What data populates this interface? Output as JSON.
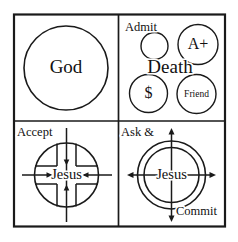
{
  "diagram": {
    "stroke_color": "#1a1a1a",
    "background_color": "#ffffff",
    "panels": [
      {
        "id": "panel-god",
        "position": "top-left",
        "center_label": "God",
        "shapes": "one large circle"
      },
      {
        "id": "panel-death",
        "position": "top-right",
        "heading_label": "Admit",
        "center_label": "Death",
        "circles": [
          {
            "id": "circle-empty",
            "label": ""
          },
          {
            "id": "circle-a-plus",
            "label": "A+"
          },
          {
            "id": "circle-dollar",
            "label": "$"
          },
          {
            "id": "circle-friend",
            "label": "Friend"
          }
        ]
      },
      {
        "id": "panel-accept",
        "position": "bottom-left",
        "heading_label": "Accept",
        "center_label": "Jesus",
        "arrow_direction": "inward",
        "shapes": "circle with cross and four inward arrows"
      },
      {
        "id": "panel-ask-commit",
        "position": "bottom-right",
        "heading_label": "Ask &",
        "footer_label": "Commit",
        "center_label": "Jesus",
        "arrow_direction": "outward",
        "shapes": "double circle with four outward arrows"
      }
    ]
  }
}
